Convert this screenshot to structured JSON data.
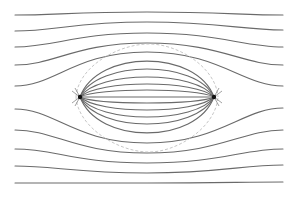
{
  "figure": {
    "type": "field-line-diagram",
    "width": 299,
    "height": 198,
    "line_color": "#6a6a6a",
    "separatrix_color": "#b8b8b8",
    "source_color": "#111111"
  },
  "sources": [
    {
      "name": "left-source",
      "x": 80,
      "y": 97
    },
    {
      "name": "right-source",
      "x": 214,
      "y": 97
    }
  ],
  "outer_lines": [
    {
      "y_left": 15,
      "y_mid": 12,
      "y_right": 15
    },
    {
      "y_left": 31,
      "y_mid": 22,
      "y_right": 30
    },
    {
      "y_left": 47,
      "y_mid": 33,
      "y_right": 47
    },
    {
      "y_left": 65,
      "y_mid": 43,
      "y_right": 65
    },
    {
      "y_left": 86,
      "y_mid": 52,
      "y_right": 86
    },
    {
      "y_left": 109,
      "y_mid": 143,
      "y_right": 108
    },
    {
      "y_left": 130,
      "y_mid": 153,
      "y_right": 130
    },
    {
      "y_left": 149,
      "y_mid": 163,
      "y_right": 149
    },
    {
      "y_left": 166,
      "y_mid": 173,
      "y_right": 165
    },
    {
      "y_left": 183,
      "y_mid": 183,
      "y_right": 182
    }
  ],
  "inner_lines_mid_y": [
    61,
    69,
    77,
    84,
    90,
    97,
    103,
    110,
    117,
    124,
    133
  ]
}
